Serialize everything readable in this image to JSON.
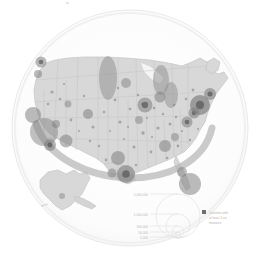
{
  "figure": {
    "title": "",
    "kind": "circular-thumbnail-map",
    "background_color": "#ffffff",
    "disc_fill": "#fbfbfb",
    "disc_stroke": "#e6e6e6",
    "land_fill": "#d6d6d6",
    "land_stroke": "#bcbcbc",
    "state_border_color": "#c2c2c2",
    "marker_color": "#8f8f8f",
    "marker_dark_color": "#5a5a5a",
    "arc_color": "#b4b4b4"
  },
  "map": {
    "region_label": "United States",
    "insets": [
      {
        "name": "alaska",
        "label": "Alaska"
      },
      {
        "name": "aleutians",
        "label": "Aleutian Islands"
      }
    ],
    "arc": {
      "name": "overlay-arc",
      "label": ""
    }
  },
  "legend": {
    "title": "",
    "size_scale": {
      "name": "graduated-circle-scale",
      "entries": [
        {
          "label": "5,000,000",
          "value": 5000000
        },
        {
          "label": "1,000,000",
          "value": 1000000
        },
        {
          "label": "500,000",
          "value": 500000
        },
        {
          "label": "50,000",
          "value": 50000
        },
        {
          "label": "5,000",
          "value": 5000
        }
      ]
    },
    "symbol_key": {
      "name": "point-symbol-key",
      "swatch_color": "#5a5a5a",
      "lines": [
        "Counties with",
        "at least 1 ice",
        "measure"
      ]
    }
  },
  "chart_data": {
    "type": "scatter",
    "title": "",
    "xlabel": "",
    "ylabel": "",
    "projection": "albers-usa",
    "size_legend_values": [
      5000000,
      1000000,
      500000,
      50000,
      5000
    ],
    "series": [
      {
        "name": "metro-population-circles",
        "points": [
          {
            "city": "Los Angeles",
            "x": 44,
            "y": 132,
            "r": 14.0,
            "shade": 0.26
          },
          {
            "city": "San Francisco",
            "x": 33,
            "y": 115,
            "r": 8.0,
            "shade": 0.3
          },
          {
            "city": "San Diego",
            "x": 50,
            "y": 145,
            "r": 6.0,
            "shade": 0.34
          },
          {
            "city": "Seattle",
            "x": 41,
            "y": 62,
            "r": 5.5,
            "shade": 0.32
          },
          {
            "city": "Portland",
            "x": 38,
            "y": 74,
            "r": 4.0,
            "shade": 0.3
          },
          {
            "city": "Phoenix",
            "x": 66,
            "y": 141,
            "r": 6.5,
            "shade": 0.3
          },
          {
            "city": "Las Vegas",
            "x": 56,
            "y": 124,
            "r": 4.0,
            "shade": 0.28
          },
          {
            "city": "Denver",
            "x": 88,
            "y": 114,
            "r": 5.0,
            "shade": 0.3
          },
          {
            "city": "Salt Lake City",
            "x": 68,
            "y": 104,
            "r": 3.5,
            "shade": 0.26
          },
          {
            "city": "Dallas",
            "x": 118,
            "y": 158,
            "r": 7.0,
            "shade": 0.3
          },
          {
            "city": "Houston",
            "x": 126,
            "y": 174,
            "r": 9.0,
            "shade": 0.38
          },
          {
            "city": "San Antonio",
            "x": 112,
            "y": 173,
            "r": 4.5,
            "shade": 0.28
          },
          {
            "city": "Minneapolis",
            "x": 126,
            "y": 83,
            "r": 5.0,
            "shade": 0.26
          },
          {
            "city": "Chicago",
            "x": 145,
            "y": 105,
            "r": 7.5,
            "shade": 0.32
          },
          {
            "city": "Detroit",
            "x": 160,
            "y": 97,
            "r": 5.5,
            "shade": 0.3
          },
          {
            "city": "St. Louis",
            "x": 139,
            "y": 120,
            "r": 4.0,
            "shade": 0.26
          },
          {
            "city": "Atlanta",
            "x": 165,
            "y": 146,
            "r": 6.0,
            "shade": 0.3
          },
          {
            "city": "Miami",
            "x": 190,
            "y": 184,
            "r": 11.0,
            "shade": 0.3
          },
          {
            "city": "Tampa",
            "x": 182,
            "y": 172,
            "r": 5.0,
            "shade": 0.28
          },
          {
            "city": "Charlotte",
            "x": 175,
            "y": 137,
            "r": 4.0,
            "shade": 0.26
          },
          {
            "city": "Washington DC",
            "x": 187,
            "y": 122,
            "r": 5.5,
            "shade": 0.32
          },
          {
            "city": "Philadelphia",
            "x": 194,
            "y": 113,
            "r": 5.5,
            "shade": 0.34
          },
          {
            "city": "New York",
            "x": 200,
            "y": 105,
            "r": 10.0,
            "shade": 0.46
          },
          {
            "city": "Boston",
            "x": 210,
            "y": 94,
            "r": 6.0,
            "shade": 0.36
          },
          {
            "city": "Anchorage",
            "x": 62,
            "y": 196,
            "r": 3.0,
            "shade": 0.22
          }
        ]
      },
      {
        "name": "tall-ellipse-markers",
        "points": [
          {
            "city": "Mountain West A",
            "x": 108,
            "y": 78,
            "rx": 9,
            "ry": 22,
            "shade": 0.26
          },
          {
            "city": "Great Lakes A",
            "x": 161,
            "y": 80,
            "rx": 8,
            "ry": 15,
            "shade": 0.26
          },
          {
            "city": "Northeast A",
            "x": 171,
            "y": 95,
            "rx": 7,
            "ry": 13,
            "shade": 0.24
          }
        ]
      },
      {
        "name": "small-county-dots",
        "points": [
          {
            "x": 52,
            "y": 92,
            "r": 1.6
          },
          {
            "x": 60,
            "y": 99,
            "r": 1.2
          },
          {
            "x": 71,
            "y": 120,
            "r": 1.4
          },
          {
            "x": 79,
            "y": 131,
            "r": 1.0
          },
          {
            "x": 84,
            "y": 96,
            "r": 1.2
          },
          {
            "x": 93,
            "y": 127,
            "r": 1.5
          },
          {
            "x": 99,
            "y": 146,
            "r": 1.2
          },
          {
            "x": 104,
            "y": 112,
            "r": 1.3
          },
          {
            "x": 110,
            "y": 131,
            "r": 1.0
          },
          {
            "x": 115,
            "y": 100,
            "r": 1.4
          },
          {
            "x": 120,
            "y": 122,
            "r": 1.6
          },
          {
            "x": 124,
            "y": 139,
            "r": 1.1
          },
          {
            "x": 130,
            "y": 109,
            "r": 1.3
          },
          {
            "x": 134,
            "y": 147,
            "r": 1.5
          },
          {
            "x": 138,
            "y": 95,
            "r": 1.2
          },
          {
            "x": 143,
            "y": 133,
            "r": 1.7
          },
          {
            "x": 147,
            "y": 118,
            "r": 1.1
          },
          {
            "x": 151,
            "y": 152,
            "r": 1.4
          },
          {
            "x": 154,
            "y": 108,
            "r": 1.3
          },
          {
            "x": 158,
            "y": 128,
            "r": 1.6
          },
          {
            "x": 163,
            "y": 114,
            "r": 1.2
          },
          {
            "x": 167,
            "y": 158,
            "r": 1.3
          },
          {
            "x": 170,
            "y": 124,
            "r": 1.5
          },
          {
            "x": 174,
            "y": 105,
            "r": 1.2
          },
          {
            "x": 178,
            "y": 146,
            "r": 1.4
          },
          {
            "x": 182,
            "y": 131,
            "r": 1.1
          },
          {
            "x": 186,
            "y": 99,
            "r": 1.3
          },
          {
            "x": 190,
            "y": 140,
            "r": 1.2
          },
          {
            "x": 193,
            "y": 90,
            "r": 1.4
          },
          {
            "x": 198,
            "y": 129,
            "r": 1.1
          },
          {
            "x": 64,
            "y": 84,
            "r": 1.1
          },
          {
            "x": 48,
            "y": 104,
            "r": 1.3
          },
          {
            "x": 90,
            "y": 141,
            "r": 1.2
          },
          {
            "x": 106,
            "y": 160,
            "r": 1.4
          },
          {
            "x": 136,
            "y": 165,
            "r": 1.2
          },
          {
            "x": 152,
            "y": 137,
            "r": 1.0
          },
          {
            "x": 118,
            "y": 88,
            "r": 1.2
          },
          {
            "x": 128,
            "y": 127,
            "r": 1.1
          },
          {
            "x": 142,
            "y": 104,
            "r": 1.3
          },
          {
            "x": 176,
            "y": 117,
            "r": 1.2
          }
        ]
      }
    ]
  }
}
